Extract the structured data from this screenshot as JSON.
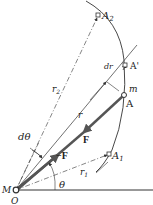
{
  "figure": {
    "labels": {
      "A2": "A",
      "A2_sub": "2",
      "A_prime": "A'",
      "dr": "dr",
      "m": "m",
      "A": "A",
      "r": "r",
      "r2": "r",
      "r2_sub": "2",
      "F": "F",
      "neg_F": "−F",
      "A1": "A",
      "A1_sub": "1",
      "r1": "r",
      "r1_sub": "1",
      "dtheta": "dθ",
      "theta": "θ",
      "M": "M",
      "O": "O"
    },
    "colors": {
      "line": "#333333",
      "force_vector": "#555555",
      "background": "#ffffff"
    }
  }
}
